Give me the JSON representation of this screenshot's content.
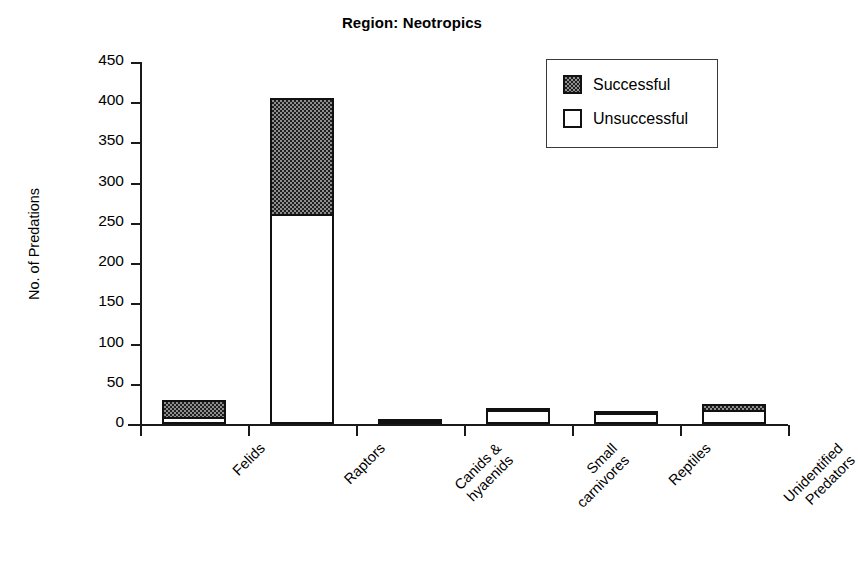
{
  "chart_data": {
    "type": "bar",
    "subtype": "stacked",
    "title": "Region: Neotropics",
    "xlabel": "",
    "ylabel": "No. of Predations",
    "ylim": [
      0,
      450
    ],
    "yticks": [
      0,
      50,
      100,
      150,
      200,
      250,
      300,
      350,
      400,
      450
    ],
    "grid": false,
    "legend_position": "top-right",
    "categories": [
      "Felids",
      "Raptors",
      "Canids &\nhyaenids",
      "Small\ncarnivores",
      "Reptiles",
      "Unidentified\nPredators"
    ],
    "series": [
      {
        "name": "Unsuccessful",
        "fill": "white",
        "values": [
          9,
          261,
          2,
          17,
          14,
          18
        ]
      },
      {
        "name": "Successful",
        "fill": "stipple-gray",
        "values": [
          23,
          147,
          1,
          1,
          5,
          10
        ]
      }
    ],
    "totals": [
      32,
      408,
      3,
      18,
      19,
      28
    ]
  },
  "legend": {
    "entries": [
      {
        "label": "Successful",
        "swatch": "stipple-gray"
      },
      {
        "label": "Unsuccessful",
        "swatch": "white"
      }
    ]
  },
  "axis": {
    "y_tick_labels": [
      "450",
      "400",
      "350",
      "300",
      "250",
      "200",
      "150",
      "100",
      "50",
      "0"
    ],
    "y_title": "No. of Predations"
  },
  "colors": {
    "axis": "#1a1a1a",
    "bar_outline": "#111111",
    "successful_fill": "#8e8e8e",
    "unsuccessful_fill": "#ffffff",
    "background": "#ffffff"
  }
}
